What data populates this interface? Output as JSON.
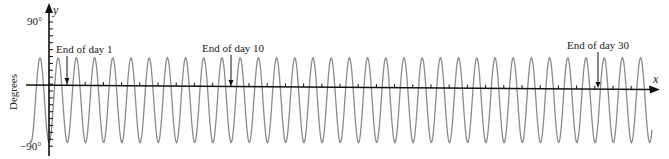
{
  "chart_data": {
    "type": "line",
    "title": "",
    "xlabel": "x",
    "ylabel": "y",
    "axis_side_label": "Degrees",
    "y_tick_labels": [
      "90°",
      "−90°"
    ],
    "ylim": [
      -90,
      90
    ],
    "x_units": "days",
    "cycles_per_day": 1,
    "days_shown": 33,
    "series": [
      {
        "name": "angle",
        "kind": "periodic-sine",
        "period_days": 1,
        "max_deg": 38,
        "min_deg": -85,
        "color": "#8c8c8c"
      }
    ],
    "annotations": [
      {
        "text": "End of day 1",
        "day": 1
      },
      {
        "text": "End of day 10",
        "day": 10
      },
      {
        "text": "End of day 30",
        "day": 30
      }
    ],
    "grid": false,
    "legend": null
  },
  "labels": {
    "y_axis": "y",
    "x_axis": "x",
    "side": "Degrees",
    "y_top": "90°",
    "y_bottom": "−90°",
    "ann_day1": "End of day 1",
    "ann_day10": "End of day 10",
    "ann_day30": "End of day 30"
  },
  "colors": {
    "axis": "#111111",
    "curve": "#8c8c8c",
    "text": "#222222"
  }
}
